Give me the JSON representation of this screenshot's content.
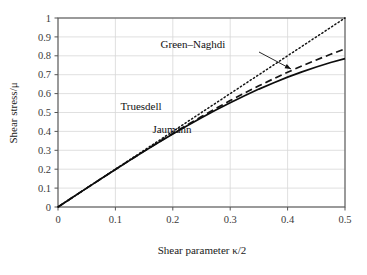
{
  "chart_data": {
    "type": "line",
    "title": "",
    "xlabel": "Shear parameter κ/2",
    "ylabel": "Shear stress/μ",
    "xlim": [
      0,
      0.5
    ],
    "ylim": [
      0,
      1
    ],
    "xticks": [
      "0",
      "0.1",
      "0.2",
      "0.3",
      "0.4",
      "0.5"
    ],
    "xtick_values": [
      0,
      0.1,
      0.2,
      0.3,
      0.4,
      0.5
    ],
    "yticks": [
      "0",
      "0.1",
      "0.2",
      "0.3",
      "0.4",
      "0.5",
      "0.6",
      "0.7",
      "0.8",
      "0.9",
      "1"
    ],
    "ytick_values": [
      0,
      0.1,
      0.2,
      0.3,
      0.4,
      0.5,
      0.6,
      0.7,
      0.8,
      0.9,
      1
    ],
    "grid": true,
    "legend_position": "inline-annotations",
    "x": [
      0,
      0.025,
      0.05,
      0.075,
      0.1,
      0.125,
      0.15,
      0.175,
      0.2,
      0.225,
      0.25,
      0.275,
      0.3,
      0.325,
      0.35,
      0.375,
      0.4,
      0.425,
      0.45,
      0.475,
      0.5
    ],
    "series": [
      {
        "name": "Truesdell",
        "style": "dotted",
        "color": "#141414",
        "values": [
          0,
          0.05,
          0.1,
          0.15,
          0.2,
          0.25,
          0.3,
          0.35,
          0.4,
          0.45,
          0.5,
          0.55,
          0.6,
          0.65,
          0.7,
          0.75,
          0.8,
          0.85,
          0.9,
          0.95,
          1.0
        ]
      },
      {
        "name": "Green–Naghdi",
        "style": "dashed",
        "color": "#141414",
        "values": [
          0,
          0.05,
          0.0998,
          0.1494,
          0.1987,
          0.2475,
          0.2956,
          0.3429,
          0.3893,
          0.4346,
          0.4787,
          0.5215,
          0.5629,
          0.6028,
          0.6412,
          0.6779,
          0.713,
          0.7464,
          0.7781,
          0.8081,
          0.8364
        ]
      },
      {
        "name": "Jaumann",
        "style": "solid",
        "color": "#0d0d0d",
        "values": [
          0,
          0.05,
          0.0998,
          0.1493,
          0.1984,
          0.2468,
          0.2944,
          0.3409,
          0.3862,
          0.4301,
          0.4725,
          0.5132,
          0.5521,
          0.589,
          0.6238,
          0.6565,
          0.687,
          0.7151,
          0.7409,
          0.7643,
          0.7852
        ]
      }
    ],
    "annotations": [
      {
        "text": "Green–Naghdi",
        "x_px": 193,
        "y_px": 48,
        "arrow": true,
        "arrow_from_x_px": 259,
        "arrow_from_y_px": 52,
        "arrow_to_x_px": 291,
        "arrow_to_y_px": 69
      },
      {
        "text": "Truesdell",
        "x_px": 141,
        "y_px": 110,
        "arrow": false
      },
      {
        "text": "Jaumann",
        "x_px": 172,
        "y_px": 133,
        "arrow": false
      }
    ],
    "colors": {
      "axis": "#555555",
      "grid": "#d8d8d8",
      "text": "#1a1a1a",
      "background": "#ffffff"
    }
  }
}
